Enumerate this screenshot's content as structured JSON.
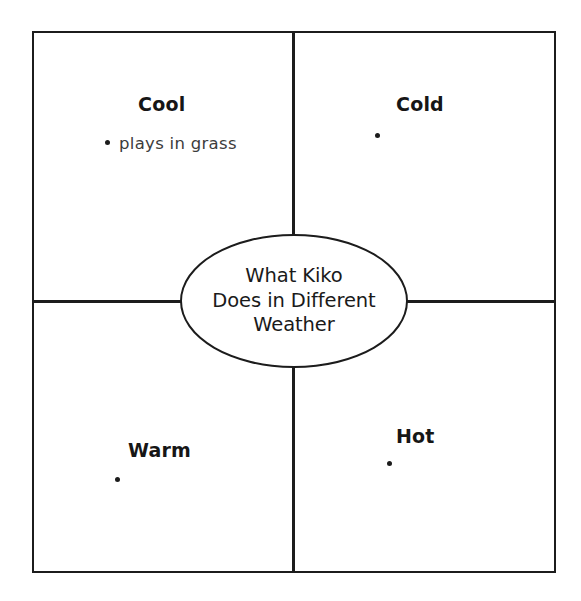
{
  "diagram": {
    "type": "four-quadrant-graphic-organizer",
    "center": {
      "text_lines": [
        "What Kiko",
        "Does in Different",
        "Weather"
      ],
      "shape": "ellipse"
    },
    "quadrants": [
      {
        "id": "cool",
        "position": "top-left",
        "heading": "Cool",
        "bullets": [
          {
            "text": "plays in grass"
          }
        ]
      },
      {
        "id": "cold",
        "position": "top-right",
        "heading": "Cold",
        "bullets": [
          {
            "text": ""
          }
        ]
      },
      {
        "id": "warm",
        "position": "bottom-left",
        "heading": "Warm",
        "bullets": [
          {
            "text": ""
          }
        ]
      },
      {
        "id": "hot",
        "position": "bottom-right",
        "heading": "Hot",
        "bullets": [
          {
            "text": ""
          }
        ]
      }
    ],
    "colors": {
      "line": "#1c1c1c",
      "heading_text": "#161616",
      "body_text": "#3c3c3c",
      "background": "#ffffff"
    }
  }
}
